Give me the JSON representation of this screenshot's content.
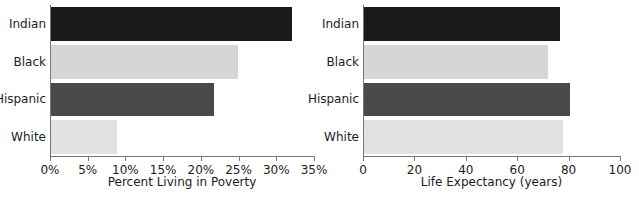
{
  "chart_data": [
    {
      "type": "bar",
      "orientation": "horizontal",
      "panel": "left",
      "title": "",
      "xlabel": "Percent Living in Poverty",
      "ylabel": "",
      "categories": [
        "Indian",
        "Black",
        "Hispanic",
        "White"
      ],
      "values": [
        32.1,
        24.9,
        21.7,
        8.9
      ],
      "xlim": [
        0,
        35
      ],
      "xticks": [
        0,
        5,
        10,
        15,
        20,
        25,
        30,
        35
      ],
      "xticklabels": [
        "0%",
        "5%",
        "10%",
        "15%",
        "20%",
        "25%",
        "30%",
        "35%"
      ],
      "bar_colors": [
        "#1a1a1a",
        "#d6d6d6",
        "#4a4a4a",
        "#e2e2e2"
      ],
      "grid": false,
      "legend": "none"
    },
    {
      "type": "bar",
      "orientation": "horizontal",
      "panel": "right",
      "title": "",
      "xlabel": "Life Expectancy (years)",
      "ylabel": "",
      "categories": [
        "Indian",
        "Black",
        "Hispanic",
        "White"
      ],
      "values": [
        76.6,
        72.0,
        80.5,
        78.0
      ],
      "xlim": [
        0,
        100
      ],
      "xticks": [
        0,
        20,
        40,
        60,
        80,
        100
      ],
      "xticklabels": [
        "0",
        "20",
        "40",
        "60",
        "80",
        "100"
      ],
      "bar_colors": [
        "#1a1a1a",
        "#d6d6d6",
        "#4a4a4a",
        "#e2e2e2"
      ],
      "grid": false,
      "legend": "none"
    }
  ],
  "colors": {
    "indian": "#1a1a1a",
    "black": "#d6d6d6",
    "hispanic": "#4a4a4a",
    "white": "#e2e2e2",
    "axis": "#777777",
    "text": "#1c1c1c",
    "background": "#ffffff"
  }
}
